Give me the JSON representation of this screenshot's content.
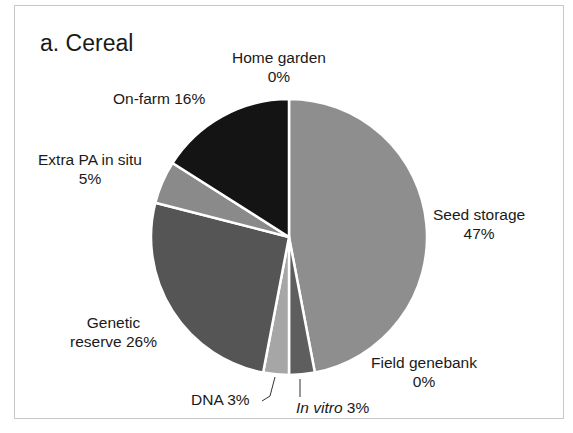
{
  "chart_data": {
    "type": "pie",
    "title": "a. Cereal",
    "start_angle_deg": 0,
    "direction": "clockwise",
    "slices": [
      {
        "label": "Seed storage",
        "value": 47,
        "display": "47%",
        "color": "#8e8e8e"
      },
      {
        "label": "Field genebank",
        "value": 0,
        "display": "0%",
        "color": "#8e8e8e"
      },
      {
        "label": "In vitro",
        "value": 3,
        "display": "3%",
        "color": "#5e5e5e"
      },
      {
        "label": "DNA",
        "value": 3,
        "display": "3%",
        "color": "#a6a6a6"
      },
      {
        "label": "Genetic reserve",
        "value": 26,
        "display": "26%",
        "color": "#555555"
      },
      {
        "label": "Extra PA in situ",
        "value": 5,
        "display": "5%",
        "color": "#8a8a8a"
      },
      {
        "label": "On-farm",
        "value": 16,
        "display": "16%",
        "color": "#141414"
      },
      {
        "label": "Home garden",
        "value": 0,
        "display": "0%",
        "color": "#141414"
      }
    ]
  },
  "labels": {
    "title": "a. Cereal",
    "home_garden_name": "Home garden",
    "home_garden_pct": "0%",
    "on_farm": "On-farm 16%",
    "extra_pa_name": "Extra PA in situ",
    "extra_pa_pct": "5%",
    "seed_storage_name": "Seed storage",
    "seed_storage_pct": "47%",
    "genetic_reserve_name": "Genetic",
    "genetic_reserve_name2": "reserve 26%",
    "field_genebank_name": "Field genebank",
    "field_genebank_pct": "0%",
    "dna": "DNA 3%",
    "in_vitro_name": "In vitro",
    "in_vitro_pct": " 3%"
  }
}
